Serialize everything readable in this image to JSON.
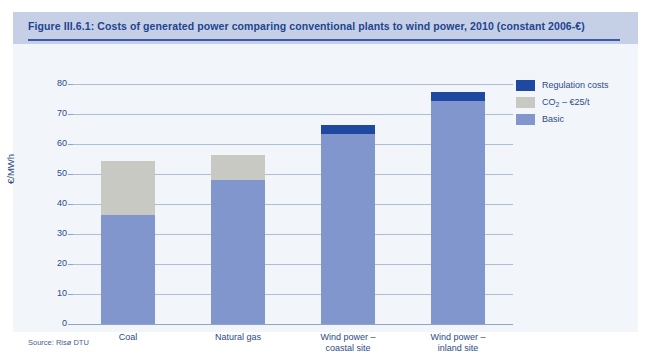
{
  "figure": {
    "title": "Figure III.6.1: Costs of generated power comparing conventional plants to wind power, 2010 (constant 2006-€)",
    "source": "Source: Risø DTU"
  },
  "colors": {
    "regulation": "#1f49a0",
    "co2": "#c9c9c4",
    "basic": "#8296ce",
    "header_band": "#c5d0e6",
    "title_text": "#23438f",
    "rule": "#3a5aa8",
    "gridline": "#aebdd6",
    "plot_background": "#f2f6fb"
  },
  "chart_data": {
    "type": "bar",
    "stacked": true,
    "title": "Figure III.6.1: Costs of generated power comparing conventional plants to wind power, 2010 (constant 2006-€)",
    "xlabel": "",
    "ylabel": "€/MWh",
    "ylim": [
      0,
      80
    ],
    "yticks": [
      0,
      10,
      20,
      30,
      40,
      50,
      60,
      70,
      80
    ],
    "ytick_labels": [
      "0",
      "10",
      "20",
      "30",
      "40",
      "50",
      "60",
      "70",
      "80"
    ],
    "grid": true,
    "legend_position": "top-right",
    "categories": [
      "Coal",
      "Natural gas",
      "Wind power –\ncoastal site",
      "Wind power –\ninland site"
    ],
    "series": [
      {
        "name": "Basic",
        "color": "#8296ce",
        "values": [
          36.5,
          48.0,
          63.5,
          74.5
        ]
      },
      {
        "name": "CO₂ – €25/t",
        "color": "#c9c9c4",
        "values": [
          18.0,
          8.5,
          0,
          0
        ]
      },
      {
        "name": "Regulation costs",
        "color": "#1f49a0",
        "values": [
          0,
          0,
          3.0,
          3.0
        ]
      }
    ],
    "totals": [
      54.5,
      56.5,
      66.5,
      77.5
    ]
  },
  "legend": {
    "items": [
      {
        "label": "Regulation costs",
        "label_sub": "",
        "color": "#1f49a0"
      },
      {
        "label": "CO",
        "label_sub": "2",
        "label_tail": " – €25/t",
        "color": "#c9c9c4"
      },
      {
        "label": "Basic",
        "label_sub": "",
        "color": "#8296ce"
      }
    ]
  }
}
